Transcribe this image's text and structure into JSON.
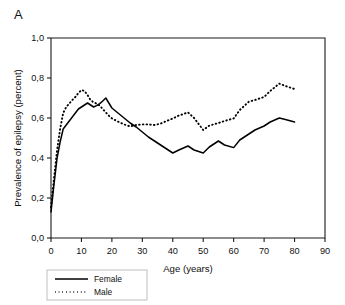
{
  "figure": {
    "panel_label": "A"
  },
  "chart_data": {
    "type": "line",
    "title": "",
    "xlabel": "Age (years)",
    "ylabel": "Prevalence of epilepsy (percent)",
    "xlim": [
      0,
      90
    ],
    "ylim": [
      0.0,
      1.0
    ],
    "xticks": [
      0,
      10,
      20,
      30,
      40,
      50,
      60,
      70,
      80,
      90
    ],
    "xticklabels": [
      "0",
      "10",
      "20",
      "30",
      "40",
      "50",
      "60",
      "70",
      "80",
      "90"
    ],
    "yticks": [
      0.0,
      0.2,
      0.4,
      0.6,
      0.8,
      1.0
    ],
    "yticklabels": [
      "0,0",
      "0,2",
      "0,4",
      "0,6",
      "0,8",
      "1,0"
    ],
    "grid": false,
    "legend_position": "below-left",
    "decimal_separator": "comma",
    "x": [
      0,
      1,
      2,
      3,
      4,
      5,
      6,
      7,
      8,
      9,
      10,
      11,
      12,
      13,
      14,
      15,
      16,
      17,
      18,
      19,
      20,
      22,
      24,
      26,
      28,
      30,
      32,
      34,
      36,
      38,
      40,
      42,
      45,
      47,
      50,
      52,
      55,
      57,
      60,
      62,
      65,
      67,
      70,
      72,
      75,
      77,
      80
    ],
    "series": [
      {
        "name": "Female",
        "style": "solid",
        "color": "#000000",
        "values": [
          0.13,
          0.27,
          0.4,
          0.48,
          0.545,
          0.565,
          0.585,
          0.605,
          0.625,
          0.645,
          0.655,
          0.665,
          0.675,
          0.665,
          0.655,
          0.662,
          0.672,
          0.685,
          0.7,
          0.675,
          0.65,
          0.625,
          0.6,
          0.575,
          0.555,
          0.53,
          0.505,
          0.485,
          0.465,
          0.445,
          0.425,
          0.44,
          0.46,
          0.44,
          0.425,
          0.455,
          0.485,
          0.465,
          0.452,
          0.49,
          0.52,
          0.54,
          0.56,
          0.58,
          0.6,
          0.592,
          0.58
        ]
      },
      {
        "name": "Male",
        "style": "dotted",
        "color": "#000000",
        "values": [
          0.155,
          0.3,
          0.44,
          0.545,
          0.625,
          0.655,
          0.672,
          0.69,
          0.705,
          0.725,
          0.74,
          0.735,
          0.715,
          0.69,
          0.678,
          0.672,
          0.662,
          0.645,
          0.628,
          0.612,
          0.598,
          0.582,
          0.568,
          0.558,
          0.565,
          0.568,
          0.568,
          0.565,
          0.572,
          0.585,
          0.598,
          0.612,
          0.628,
          0.6,
          0.54,
          0.562,
          0.575,
          0.585,
          0.598,
          0.64,
          0.682,
          0.69,
          0.705,
          0.735,
          0.772,
          0.76,
          0.745
        ]
      }
    ],
    "legend": [
      {
        "label": "Female",
        "style": "solid"
      },
      {
        "label": "Male",
        "style": "dotted"
      }
    ]
  }
}
